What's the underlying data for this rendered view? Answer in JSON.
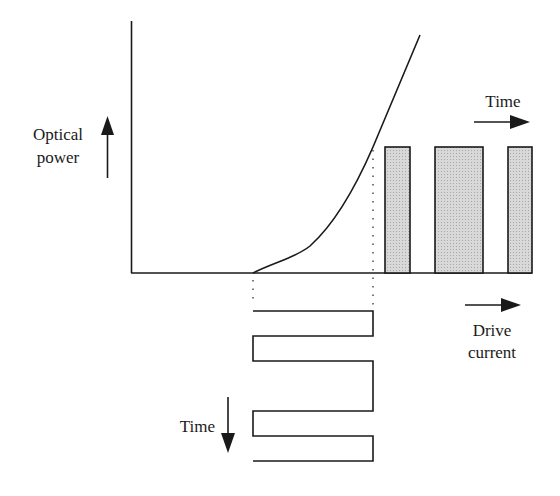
{
  "diagram": {
    "labels": {
      "y_axis_line1": "Optical",
      "y_axis_line2": "power",
      "x_axis_line1": "Drive",
      "x_axis_line2": "current",
      "output_time": "Time",
      "input_time": "Time"
    },
    "colors": {
      "line": "#1a1a1a",
      "bar_fill": "#cfcfcf",
      "background": "#ffffff"
    },
    "output_pulses": [
      {
        "x_start": 385,
        "x_end": 410
      },
      {
        "x_start": 435,
        "x_end": 483
      },
      {
        "x_start": 508,
        "x_end": 532
      }
    ],
    "input_waveform": {
      "low_x": 253,
      "high_x": 373,
      "levels_y": [
        311,
        336,
        361,
        411,
        436,
        461
      ]
    }
  }
}
